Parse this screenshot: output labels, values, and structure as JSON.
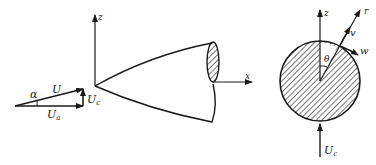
{
  "figure": {
    "velocity_triangle": {
      "labels": {
        "angle": "α",
        "resultant": "U",
        "axial": "U",
        "axial_sub": "a",
        "crossflow": "U",
        "crossflow_sub": "c"
      }
    },
    "body_view": {
      "axis_labels": {
        "vertical": "z",
        "horizontal": "x"
      }
    },
    "cross_section": {
      "axis_labels": {
        "vertical": "z",
        "radial": "r"
      },
      "velocity_labels": {
        "radial": "v",
        "tangential": "w"
      },
      "angle_label": "θ",
      "incoming_flow": {
        "label": "U",
        "sub": "c"
      }
    },
    "colors": {
      "ink": "#1a1a1a",
      "background": "#ffffff"
    }
  }
}
